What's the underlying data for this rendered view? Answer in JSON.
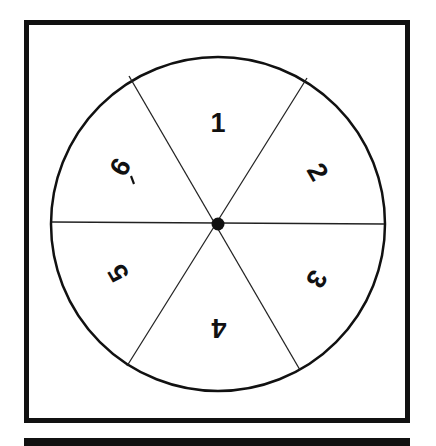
{
  "spinner": {
    "segments": [
      {
        "label": "1",
        "angle": 0
      },
      {
        "label": "2",
        "angle": 60
      },
      {
        "label": "3",
        "angle": 120
      },
      {
        "label": "4",
        "angle": 180
      },
      {
        "label": "5",
        "angle": 240
      },
      {
        "label": "6",
        "angle": 300
      }
    ],
    "segment_count": 6
  },
  "colors": {
    "ink": "#111111",
    "background": "#ffffff"
  }
}
